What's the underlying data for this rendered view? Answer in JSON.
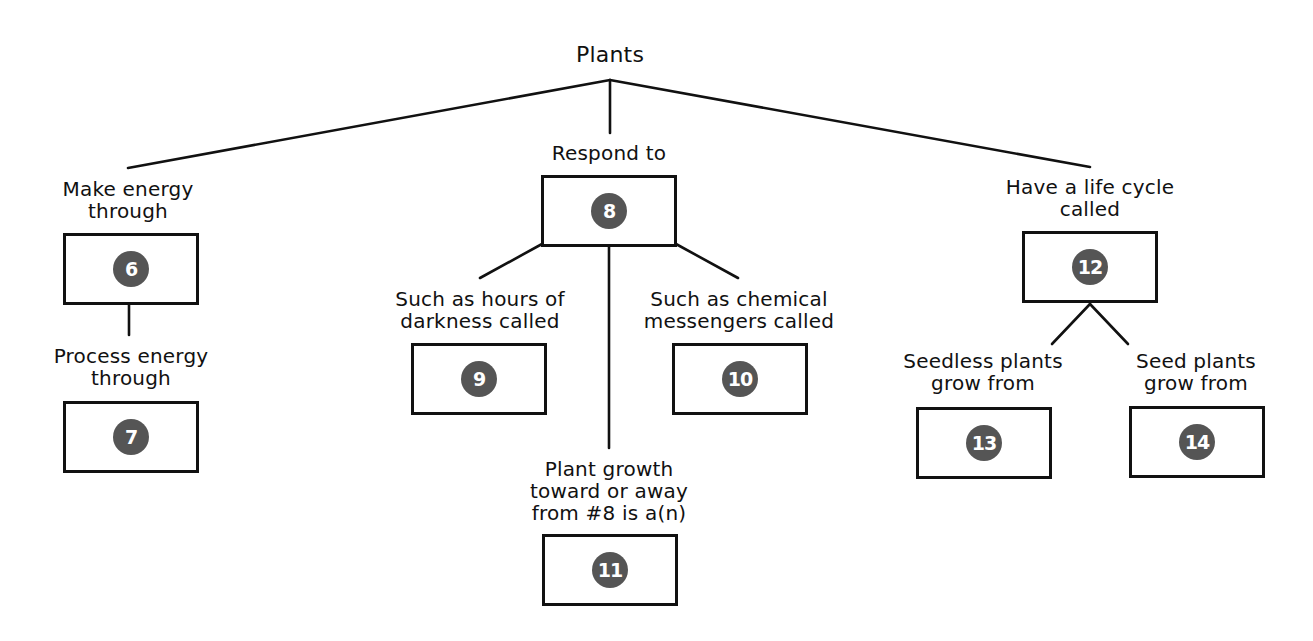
{
  "diagram": {
    "title": "Plants",
    "badge_color": "#555555",
    "line_color": "#111111",
    "branches": {
      "energy": {
        "label": [
          "Make energy",
          "through"
        ],
        "answer_number": "6",
        "child": {
          "label": [
            "Process energy",
            "through"
          ],
          "answer_number": "7"
        }
      },
      "respond": {
        "label": [
          "Respond to"
        ],
        "answer_number": "8",
        "children": {
          "darkness": {
            "label": [
              "Such as hours of",
              "darkness called"
            ],
            "answer_number": "9"
          },
          "chemical": {
            "label": [
              "Such as chemical",
              "messengers called"
            ],
            "answer_number": "10"
          },
          "growth": {
            "label": [
              "Plant growth",
              "toward or away",
              "from #8 is a(n)"
            ],
            "answer_number": "11"
          }
        }
      },
      "lifecycle": {
        "label": [
          "Have a life cycle",
          "called"
        ],
        "answer_number": "12",
        "children": {
          "seedless": {
            "label": [
              "Seedless plants",
              "grow from"
            ],
            "answer_number": "13"
          },
          "seed": {
            "label": [
              "Seed plants",
              "grow from"
            ],
            "answer_number": "14"
          }
        }
      }
    }
  }
}
